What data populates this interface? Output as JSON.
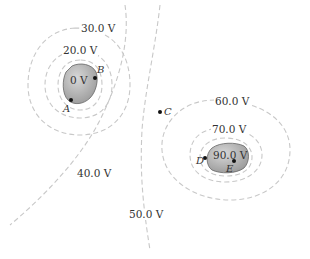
{
  "diagram": {
    "type": "equipotential-map",
    "equipotentials": [
      {
        "id": "v20",
        "label": "20.0 V"
      },
      {
        "id": "v30",
        "label": "30.0 V"
      },
      {
        "id": "v40",
        "label": "40.0 V"
      },
      {
        "id": "v50",
        "label": "50.0 V"
      },
      {
        "id": "v60",
        "label": "60.0 V"
      },
      {
        "id": "v70",
        "label": "70.0 V"
      }
    ],
    "conductors": [
      {
        "id": "left",
        "label": "0 V",
        "fill": "#b8b8b8"
      },
      {
        "id": "right",
        "label": "90.0 V",
        "fill": "#b8b8b8"
      }
    ],
    "points": [
      {
        "id": "A",
        "label": "A"
      },
      {
        "id": "B",
        "label": "B"
      },
      {
        "id": "C",
        "label": "C"
      },
      {
        "id": "D",
        "label": "D"
      },
      {
        "id": "E",
        "label": "E"
      }
    ],
    "colors": {
      "line": "#c8c8c8",
      "text": "#333333",
      "conductor": "#b8b8b8"
    }
  }
}
